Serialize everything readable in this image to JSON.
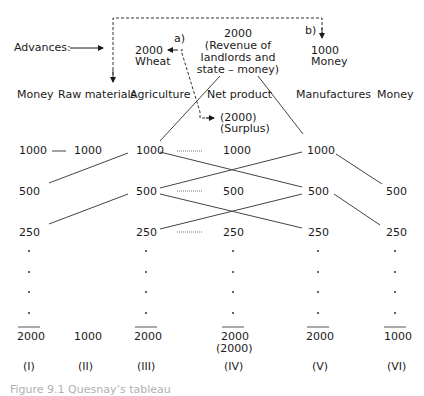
{
  "advances": {
    "label": "Advances:",
    "a_label": "a)",
    "b_label": "b)",
    "wheat_amount": "2000",
    "wheat_label": "Wheat",
    "revenue_amount": "2000",
    "revenue_line1": "(Revenue of",
    "revenue_line2": "landlords and",
    "revenue_line3": "state – money)",
    "money_amount": "1000",
    "money_label": "Money",
    "surplus_amount": "(2000)",
    "surplus_label": "(Surplus)"
  },
  "columns": [
    {
      "header": "Money",
      "roman": "(I)",
      "values": [
        "1000",
        "500",
        "250"
      ],
      "total": "2000"
    },
    {
      "header": "Raw materials",
      "roman": "(II)",
      "values": [
        "1000"
      ],
      "total": "1000"
    },
    {
      "header": "Agriculture",
      "roman": "(III)",
      "values": [
        "1000",
        "500",
        "250"
      ],
      "total": "2000"
    },
    {
      "header": "Net product",
      "roman": "(IV)",
      "values": [
        "1000",
        "500",
        "250"
      ],
      "total": "2000",
      "total_note": "(2000)"
    },
    {
      "header": "Manufactures",
      "roman": "(V)",
      "values": [
        "1000",
        "500",
        "250"
      ],
      "total": "2000"
    },
    {
      "header": "Money",
      "roman": "(VI)",
      "values": [
        "500",
        "250"
      ],
      "total": "1000"
    }
  ],
  "caption": "Figure 9.1  Quesnay’s tableau"
}
